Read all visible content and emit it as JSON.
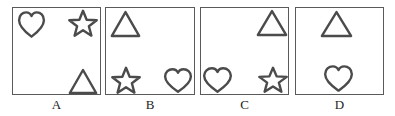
{
  "figure": {
    "background_color": "#ffffff",
    "stroke_color": "#4b4b4b",
    "border_color": "#5a5a5a",
    "label_color": "#1c1c1c",
    "panels": [
      {
        "label": "A",
        "box": {
          "x": 12,
          "y": 7,
          "w": 89,
          "h": 88
        },
        "label_pos": {
          "x": 12,
          "y": 98,
          "w": 89
        },
        "shapes": [
          {
            "type": "heart",
            "icon": "heart-icon",
            "position": "top-left",
            "x": 18,
            "y": 11,
            "w": 27,
            "h": 27
          },
          {
            "type": "star",
            "icon": "star-icon",
            "position": "top-right",
            "x": 69,
            "y": 10,
            "w": 28,
            "h": 27
          },
          {
            "type": "triangle",
            "icon": "triangle-icon",
            "position": "bottom-right",
            "x": 69,
            "y": 69,
            "w": 28,
            "h": 25
          }
        ]
      },
      {
        "label": "B",
        "box": {
          "x": 105,
          "y": 7,
          "w": 90,
          "h": 88
        },
        "label_pos": {
          "x": 105,
          "y": 98,
          "w": 90
        },
        "shapes": [
          {
            "type": "triangle",
            "icon": "triangle-icon",
            "position": "top-left",
            "x": 111,
            "y": 11,
            "w": 29,
            "h": 26
          },
          {
            "type": "star",
            "icon": "star-icon",
            "position": "bottom-left",
            "x": 112,
            "y": 67,
            "w": 28,
            "h": 27
          },
          {
            "type": "heart",
            "icon": "heart-icon",
            "position": "bottom-right",
            "x": 164,
            "y": 68,
            "w": 28,
            "h": 25
          }
        ]
      },
      {
        "label": "C",
        "box": {
          "x": 200,
          "y": 7,
          "w": 89,
          "h": 88
        },
        "label_pos": {
          "x": 200,
          "y": 98,
          "w": 89
        },
        "shapes": [
          {
            "type": "triangle",
            "icon": "triangle-icon",
            "position": "top-right",
            "x": 257,
            "y": 10,
            "w": 30,
            "h": 26
          },
          {
            "type": "heart",
            "icon": "heart-icon",
            "position": "bottom-left",
            "x": 203,
            "y": 67,
            "w": 29,
            "h": 26
          },
          {
            "type": "star",
            "icon": "star-icon",
            "position": "bottom-right",
            "x": 259,
            "y": 67,
            "w": 28,
            "h": 26
          }
        ]
      },
      {
        "label": "D",
        "box": {
          "x": 295,
          "y": 7,
          "w": 89,
          "h": 88
        },
        "label_pos": {
          "x": 295,
          "y": 98,
          "w": 89
        },
        "shapes": [
          {
            "type": "triangle",
            "icon": "triangle-icon",
            "position": "top-center",
            "x": 321,
            "y": 11,
            "w": 31,
            "h": 26
          },
          {
            "type": "heart",
            "icon": "heart-icon",
            "position": "bottom-center",
            "x": 324,
            "y": 65,
            "w": 29,
            "h": 27
          }
        ]
      }
    ]
  }
}
